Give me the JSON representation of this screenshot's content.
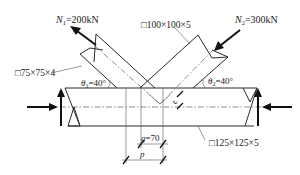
{
  "diagram": {
    "forces": {
      "n1": {
        "symbol": "N",
        "subscript": "1",
        "value": "=200kN"
      },
      "n2": {
        "symbol": "N",
        "subscript": "2",
        "value": "=300kN"
      }
    },
    "members": {
      "brace_left_section": "□75×75×4",
      "brace_right_section": "□100×100×5",
      "chord_section": "□125×125×5"
    },
    "angles": {
      "theta1": {
        "symbol": "θ",
        "subscript": "1",
        "value": "=40°"
      },
      "theta2": {
        "symbol": "θ",
        "subscript": "2",
        "value": "=40°"
      }
    },
    "dimensions": {
      "gap": "g=70",
      "gap_symbol": "g",
      "gap_value": "=70",
      "pitch": "p",
      "eccentricity": "e"
    }
  }
}
